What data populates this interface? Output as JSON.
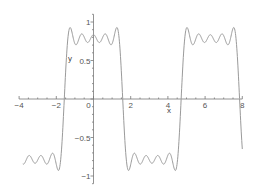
{
  "chart_data": {
    "type": "line",
    "title": "",
    "xlabel": "x",
    "ylabel": "y",
    "xlim": [
      -4,
      8
    ],
    "ylim": [
      -1.1,
      1.1
    ],
    "grid": false,
    "legend": null,
    "x_ticks": [
      -4,
      -2,
      0,
      2,
      4,
      6,
      8
    ],
    "x_tick_labels": [
      "−4",
      "−2",
      "0",
      "2",
      "4",
      "6",
      "8"
    ],
    "y_ticks": [
      -1,
      -0.5,
      0,
      0.5,
      1
    ],
    "y_tick_labels": [
      "−1",
      "−0.5",
      "0",
      "0.5",
      "1"
    ],
    "series": [
      {
        "name": "partial Fourier sum: cos x - cos3x/3 + cos5x/5 - cos7x/7 + cos9x/9",
        "color": "#9a9a9a",
        "terms": 5,
        "x_range": [
          -3.8,
          8.0
        ],
        "description": "Fourier partial sum of a square wave (Gibbs ripples), peaks ~0.92, center ~0.83, troughs ~0.73; transitions near x = -1.57, 1.57, 4.71, 7.85"
      }
    ]
  }
}
